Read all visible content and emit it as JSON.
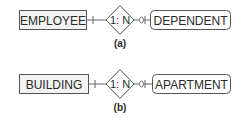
{
  "diagrams": [
    {
      "caption": "(a)",
      "left_entity": "EMPLOYEE",
      "relationship": "1: N",
      "right_entity": "DEPENDENT",
      "left_cardinality": "one-mandatory",
      "right_cardinality": "zero-or-many-optional"
    },
    {
      "caption": "(b)",
      "left_entity": "BUILDING",
      "relationship": "1: N",
      "right_entity": "APARTMENT",
      "left_cardinality": "one-mandatory",
      "right_cardinality": "zero-or-many-optional"
    }
  ],
  "colors": {
    "stroke": "#555555",
    "strong_entity_fill": "#f2f2f2",
    "weak_entity_fill": "#ffffff",
    "text": "#2a2a2a"
  }
}
